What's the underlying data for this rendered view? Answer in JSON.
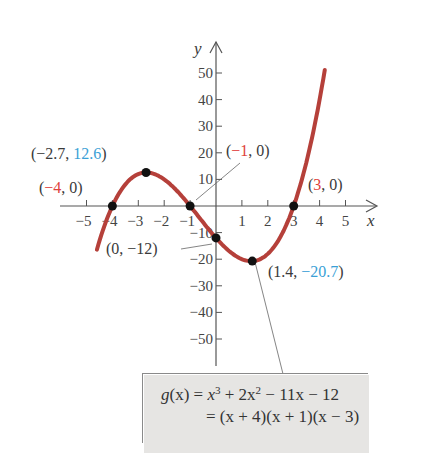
{
  "chart_data": {
    "type": "line",
    "title": "",
    "xlabel": "x",
    "ylabel": "y",
    "xlim": [
      -5.5,
      5.5
    ],
    "ylim": [
      -60,
      60
    ],
    "grid": false,
    "x_ticks": [
      -5,
      -4,
      -3,
      -2,
      -1,
      1,
      2,
      3,
      4,
      5
    ],
    "x_tick_labels": [
      "−5",
      "−4",
      "−3",
      "−2",
      "−1",
      "1",
      "2",
      "3",
      "4",
      "5"
    ],
    "y_ticks": [
      50,
      40,
      30,
      20,
      10,
      -10,
      -20,
      -30,
      -40,
      -50
    ],
    "y_tick_labels": [
      "50",
      "40",
      "30",
      "20",
      "10",
      "−10",
      "−20",
      "−30",
      "−40",
      "−50"
    ],
    "series": [
      {
        "name": "g(x) = x^3 + 2x^2 - 11x - 12",
        "color": "#b5403a",
        "x": [
          -4.6,
          -4.0,
          -3.5,
          -3.0,
          -2.7,
          -2.0,
          -1.0,
          0.0,
          1.0,
          1.4,
          2.0,
          3.0,
          3.5,
          4.0,
          4.2
        ],
        "y": [
          -19.6,
          0.0,
          10.1,
          12.0,
          12.6,
          10.0,
          0.0,
          -12.0,
          -20.0,
          -20.7,
          -18.0,
          0.0,
          15.4,
          40.0,
          52.2
        ]
      }
    ],
    "points": [
      {
        "x": -4,
        "y": 0,
        "label": "(−4, 0)",
        "kind": "zero"
      },
      {
        "x": -2.7,
        "y": 12.6,
        "label": "(−2.7, 12.6)",
        "kind": "local-max"
      },
      {
        "x": -1,
        "y": 0,
        "label": "(−1, 0)",
        "kind": "zero"
      },
      {
        "x": 0,
        "y": -12,
        "label": "(0, −12)",
        "kind": "y-intercept"
      },
      {
        "x": 1.4,
        "y": -20.7,
        "label": "(1.4, −20.7)",
        "kind": "local-min"
      },
      {
        "x": 3,
        "y": 0,
        "label": "(3, 0)",
        "kind": "zero"
      }
    ],
    "annotations": {
      "formula_line1": "g(x) = x^3 + 2x^2 − 11x − 12",
      "formula_line2": "= (x + 4)(x + 1)(x − 3)"
    },
    "colors": {
      "curve": "#b5403a",
      "zero_highlight": "#e0413a",
      "extremum_highlight": "#3a9fd6",
      "point": "#111111",
      "text": "#3a3a3a",
      "formula_bg": "#e6e5e3"
    }
  },
  "labels": {
    "x_axis": "x",
    "y_axis": "y",
    "pt_max": {
      "open": "(−2.7, ",
      "hl": "12.6",
      "close": ")"
    },
    "pt_zero_m4": {
      "open": "(",
      "hl": "−4",
      "close": ", 0)"
    },
    "pt_zero_m1": {
      "open": "(",
      "hl": "−1",
      "close": ", 0)"
    },
    "pt_zero_3": {
      "open": "(",
      "hl": "3",
      "close": ", 0)"
    },
    "pt_yint": {
      "text": "(0, −12)"
    },
    "pt_min": {
      "open": "(1.4, ",
      "hl": "−20.7",
      "close": ")"
    }
  },
  "formula": {
    "lhs": "g",
    "arg": "(x)",
    "eq": " = ",
    "t1": "x",
    "e1": "3",
    "t2": " + 2x",
    "e2": "2",
    "t3": " − 11x − 12",
    "line2": "= (x + 4)(x + 1)(x − 3)"
  }
}
